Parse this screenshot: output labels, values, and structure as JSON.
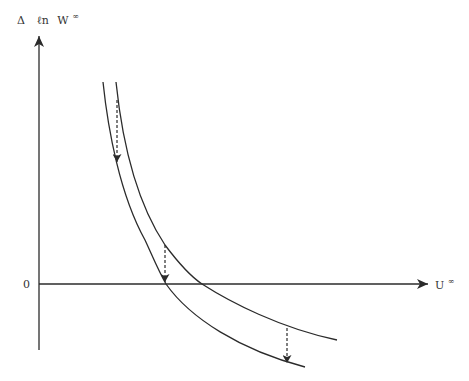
{
  "diagram": {
    "y_axis_label": {
      "delta": "Δ",
      "ell_n": "ℓn",
      "var": "W",
      "sup": "∞"
    },
    "x_axis_label": {
      "var": "U",
      "sup": "∞"
    },
    "origin_label": "0",
    "colors": {
      "line": "#2b2b2b",
      "background": "#ffffff"
    },
    "curves": [
      {
        "name": "upper-curve",
        "description": "original curve (shifted right/up)"
      },
      {
        "name": "lower-curve",
        "description": "shifted curve (down/left)"
      }
    ],
    "shift_arrows": [
      {
        "name": "shift-arrow-top",
        "style": "dashed",
        "direction": "down"
      },
      {
        "name": "shift-arrow-middle",
        "style": "dashed",
        "direction": "down"
      },
      {
        "name": "shift-arrow-bottom",
        "style": "dashed",
        "direction": "down"
      }
    ]
  }
}
